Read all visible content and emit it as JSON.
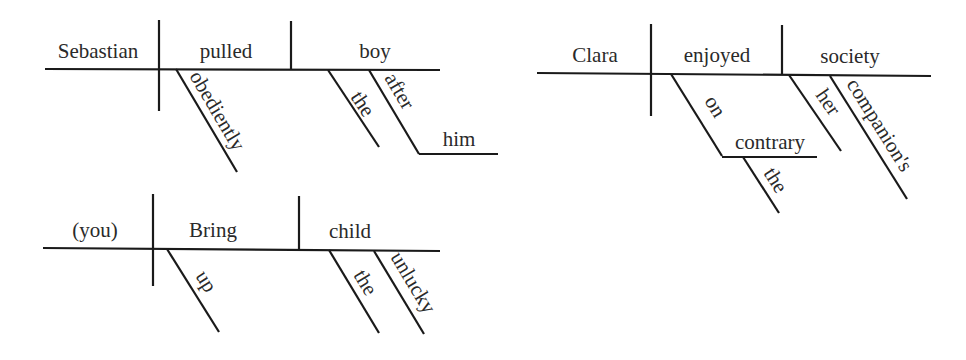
{
  "diagrams": [
    {
      "sentence_label": "Sebastian obediently pulled the boy after him",
      "subject": "Sebastian",
      "verb": "pulled",
      "object": "boy",
      "verb_modifiers": [
        "obediently"
      ],
      "object_modifiers": [
        "the",
        "after"
      ],
      "prepositional_object": "him"
    },
    {
      "sentence_label": "Clara, on the contrary, enjoyed her companion's society",
      "subject": "Clara",
      "verb": "enjoyed",
      "object": "society",
      "verb_modifiers": [
        "on"
      ],
      "prepositional_object": "contrary",
      "prepositional_object_modifiers": [
        "the"
      ],
      "object_modifiers": [
        "her",
        "companion's"
      ]
    },
    {
      "sentence_label": "Bring up the unlucky child",
      "subject": "(you)",
      "verb": "Bring",
      "object": "child",
      "verb_modifiers": [
        "up"
      ],
      "object_modifiers": [
        "the",
        "unlucky"
      ]
    }
  ],
  "style": {
    "line_color": "#1a1a1a",
    "text_color": "#2a2a2a",
    "background": "#ffffff"
  }
}
